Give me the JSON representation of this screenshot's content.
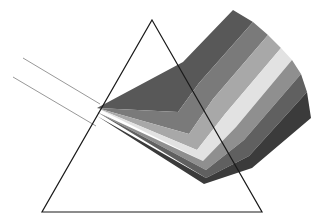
{
  "figure": {
    "kind": "diagram",
    "width": 318,
    "height": 219,
    "background_color": "#ffffff"
  },
  "prism": {
    "label": "triangular-prism",
    "outline_color": "#1a1a1a",
    "stroke_width": 1.2,
    "fill": "none",
    "vertices": [
      {
        "name": "apex",
        "x": 152,
        "y": 20
      },
      {
        "name": "bottom-right",
        "x": 262,
        "y": 212
      },
      {
        "name": "bottom-left",
        "x": 42,
        "y": 212
      }
    ]
  },
  "incident_rays": {
    "label": "incoming-white-light",
    "color": "#8c8c8c",
    "stroke_width": 0.9,
    "count": 2,
    "rays": [
      {
        "name": "upper-incident-ray",
        "x1": 23,
        "y1": 58,
        "x2": 100,
        "y2": 104
      },
      {
        "name": "lower-incident-ray",
        "x1": 13,
        "y1": 77,
        "x2": 96,
        "y2": 126
      }
    ]
  },
  "dispersion": {
    "label": "refracted-spectrum-fan",
    "entry_point": {
      "x": 97,
      "y": 108
    },
    "band_count": 7,
    "bands": [
      {
        "name": "band-1",
        "color": "#585858",
        "points": "97,108 183,62 233,10 253,22 199,83 178,112"
      },
      {
        "name": "band-2",
        "color": "#7a7a7a",
        "points": "97,108 178,112 199,83 253,22 268,35 213,99 189,134"
      },
      {
        "name": "band-3",
        "color": "#a8a8a8",
        "points": "97,108 189,134 213,99 268,35 281,48 225,114 197,150"
      },
      {
        "name": "band-4",
        "color": "#e2e2e2",
        "points": "97,108 197,150 225,114 281,48 292,60 236,127 203,161"
      },
      {
        "name": "band-5",
        "color": "#8f8f8f",
        "points": "97,112 203,161 236,127 292,60 301,74 244,140 206,170"
      },
      {
        "name": "band-6",
        "color": "#606060",
        "points": "97,112 206,170 244,140 301,74 307,92 249,156 206,178"
      },
      {
        "name": "band-7",
        "color": "#3b3b3b",
        "points": "97,116 206,178 249,156 307,92 311,118 252,168 204,184"
      }
    ]
  },
  "legend": {
    "visible": false,
    "items": []
  },
  "annotations": []
}
